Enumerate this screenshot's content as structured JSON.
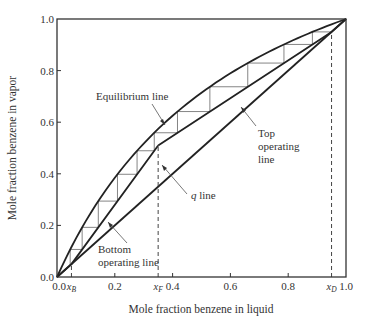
{
  "chart_data": {
    "type": "line",
    "title": "",
    "xlabel": "Mole fraction benzene in liquid",
    "ylabel": "Mole fraction benzene in vapor",
    "xlim": [
      0.0,
      1.0
    ],
    "ylim": [
      0.0,
      1.0
    ],
    "grid": false,
    "x_ticks": [
      "0.0",
      "0.2",
      "0.4",
      "0.6",
      "0.8",
      "1.0"
    ],
    "x_tick_values": [
      0.0,
      0.2,
      0.4,
      0.6,
      0.8,
      1.0
    ],
    "y_ticks": [
      "0.0",
      "0.2",
      "0.4",
      "0.6",
      "0.8",
      "1.0"
    ],
    "y_tick_values": [
      0.0,
      0.2,
      0.4,
      0.6,
      0.8,
      1.0
    ],
    "special_x_ticks": [
      {
        "label": "x_B",
        "base": "x",
        "sub": "B",
        "value": 0.05
      },
      {
        "label": "x_F",
        "base": "x",
        "sub": "F",
        "value": 0.35
      },
      {
        "label": "x_D",
        "base": "x",
        "sub": "D",
        "value": 0.95
      }
    ],
    "relative_volatility": 2.5,
    "series": [
      {
        "name": "Equilibrium line",
        "x": [
          0.0,
          0.05,
          0.1,
          0.2,
          0.3,
          0.35,
          0.4,
          0.5,
          0.6,
          0.7,
          0.8,
          0.9,
          0.95,
          1.0
        ],
        "y": [
          0.0,
          0.116,
          0.217,
          0.385,
          0.517,
          0.574,
          0.625,
          0.714,
          0.789,
          0.854,
          0.909,
          0.957,
          0.979,
          1.0
        ]
      },
      {
        "name": "Diagonal (y = x) / q line",
        "x": [
          0.0,
          1.0
        ],
        "y": [
          0.0,
          1.0
        ]
      },
      {
        "name": "Top operating line",
        "x": [
          0.35,
          0.95,
          1.0
        ],
        "y": [
          0.51,
          0.95,
          1.0
        ]
      },
      {
        "name": "Bottom operating line",
        "x": [
          0.0,
          0.05,
          0.35
        ],
        "y": [
          0.0,
          0.05,
          0.51
        ]
      }
    ],
    "feed_point": {
      "x": 0.35,
      "y": 0.51
    },
    "stages": 11,
    "annotations": [
      {
        "text": "Equilibrium line",
        "points_to": "Equilibrium line"
      },
      {
        "text": "Top operating line",
        "points_to": "Top operating line"
      },
      {
        "text": "q line",
        "points_to": "q line"
      },
      {
        "text": "Bottom operating line",
        "points_to": "Bottom operating line"
      }
    ]
  },
  "labels": {
    "xlabel": "Mole fraction benzene in liquid",
    "ylabel": "Mole fraction benzene in vapor",
    "equilibrium": "Equilibrium line",
    "top_op_1": "Top",
    "top_op_2": "operating",
    "top_op_3": "line",
    "q_italic": "q",
    "q_rest": " line",
    "bottom_op_1": "Bottom",
    "bottom_op_2": "operating line"
  }
}
